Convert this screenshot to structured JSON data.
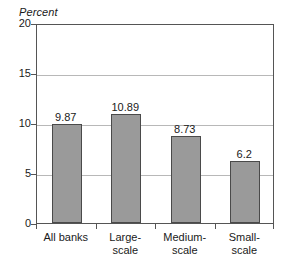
{
  "chart_data": {
    "type": "bar",
    "title": "",
    "subtitle": "",
    "xlabel": "",
    "ylabel": "Percent",
    "ylim": [
      0,
      20
    ],
    "yticks": [
      0,
      5,
      10,
      15,
      20
    ],
    "ytick_labels": [
      "0",
      "5",
      "10",
      "15",
      "20"
    ],
    "grid": true,
    "legend": false,
    "legend_position": "none",
    "categories": [
      "All banks",
      "Large-scale",
      "Medium-scale",
      "Small-scale"
    ],
    "category_lines": [
      [
        "All banks"
      ],
      [
        "Large-",
        "scale"
      ],
      [
        "Medium-",
        "scale"
      ],
      [
        "Small-",
        "scale"
      ]
    ],
    "values": [
      9.87,
      10.89,
      8.73,
      6.2
    ],
    "value_labels": [
      "9.87",
      "10.89",
      "8.73",
      "6.2"
    ],
    "bar_fill_color": "#9a9a9a",
    "bar_border_color": "#4a4a4a",
    "gridline_color": "#b8b8b8",
    "axis_color": "#555555",
    "background_color": "#ffffff",
    "text_color": "#1a1a1a"
  }
}
